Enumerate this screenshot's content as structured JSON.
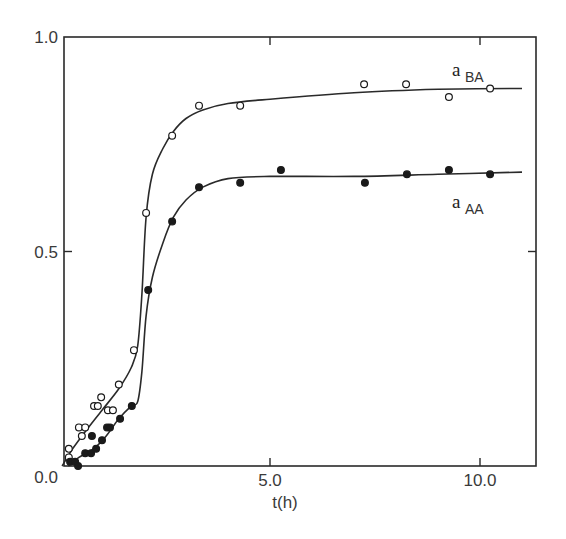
{
  "chart_data": {
    "type": "scatter",
    "title": "",
    "xlabel": "t(h)",
    "ylabel": "",
    "xlim": [
      0,
      11.3
    ],
    "ylim": [
      0.0,
      1.0
    ],
    "grid": false,
    "legend_position": "inline labels at right end of curves",
    "x_ticks": [
      0,
      5.0,
      10.0
    ],
    "x_tick_labels": [
      "",
      "5.0",
      "10.0"
    ],
    "y_ticks": [
      0.0,
      0.5,
      1.0
    ],
    "y_tick_labels": [
      "0.0",
      "0.5",
      "1.0"
    ],
    "series": [
      {
        "name": "a_BA",
        "label_main": "a",
        "label_sub": "BA",
        "marker": "open-circle",
        "points": [
          [
            0.21,
            0.02
          ],
          [
            0.21,
            0.04
          ],
          [
            0.45,
            0.09
          ],
          [
            0.52,
            0.07
          ],
          [
            0.6,
            0.09
          ],
          [
            0.81,
            0.14
          ],
          [
            0.9,
            0.14
          ],
          [
            0.98,
            0.16
          ],
          [
            1.14,
            0.13
          ],
          [
            1.26,
            0.13
          ],
          [
            1.4,
            0.19
          ],
          [
            1.76,
            0.27
          ],
          [
            2.05,
            0.59
          ],
          [
            2.67,
            0.77
          ],
          [
            3.31,
            0.84
          ],
          [
            4.29,
            0.84
          ],
          [
            7.24,
            0.89
          ],
          [
            8.24,
            0.89
          ],
          [
            9.26,
            0.86
          ],
          [
            10.24,
            0.88
          ]
        ],
        "fit_curve": [
          [
            0.05,
            0.0
          ],
          [
            0.3,
            0.04
          ],
          [
            0.6,
            0.08
          ],
          [
            1.0,
            0.13
          ],
          [
            1.4,
            0.18
          ],
          [
            1.7,
            0.23
          ],
          [
            1.85,
            0.28
          ],
          [
            1.95,
            0.4
          ],
          [
            2.05,
            0.58
          ],
          [
            2.2,
            0.68
          ],
          [
            2.45,
            0.74
          ],
          [
            2.7,
            0.78
          ],
          [
            3.0,
            0.81
          ],
          [
            3.4,
            0.83
          ],
          [
            4.0,
            0.845
          ],
          [
            5.0,
            0.855
          ],
          [
            7.0,
            0.87
          ],
          [
            9.0,
            0.878
          ],
          [
            11.0,
            0.88
          ]
        ]
      },
      {
        "name": "a_AA",
        "label_main": "a",
        "label_sub": "AA",
        "marker": "filled-circle",
        "points": [
          [
            0.24,
            0.01
          ],
          [
            0.36,
            0.01
          ],
          [
            0.43,
            0.0
          ],
          [
            0.6,
            0.03
          ],
          [
            0.74,
            0.03
          ],
          [
            0.76,
            0.07
          ],
          [
            0.86,
            0.04
          ],
          [
            1.0,
            0.06
          ],
          [
            1.12,
            0.09
          ],
          [
            1.19,
            0.09
          ],
          [
            1.43,
            0.11
          ],
          [
            1.71,
            0.14
          ],
          [
            2.1,
            0.41
          ],
          [
            2.67,
            0.57
          ],
          [
            3.31,
            0.65
          ],
          [
            4.29,
            0.66
          ],
          [
            5.26,
            0.69
          ],
          [
            7.26,
            0.66
          ],
          [
            8.26,
            0.68
          ],
          [
            9.26,
            0.69
          ],
          [
            10.24,
            0.68
          ]
        ],
        "fit_curve": [
          [
            0.2,
            0.0
          ],
          [
            0.45,
            0.02
          ],
          [
            0.8,
            0.04
          ],
          [
            1.1,
            0.07
          ],
          [
            1.4,
            0.11
          ],
          [
            1.7,
            0.14
          ],
          [
            1.85,
            0.15
          ],
          [
            1.95,
            0.22
          ],
          [
            2.05,
            0.35
          ],
          [
            2.2,
            0.44
          ],
          [
            2.45,
            0.52
          ],
          [
            2.7,
            0.58
          ],
          [
            3.0,
            0.62
          ],
          [
            3.4,
            0.65
          ],
          [
            4.0,
            0.67
          ],
          [
            5.0,
            0.675
          ],
          [
            7.0,
            0.675
          ],
          [
            9.0,
            0.68
          ],
          [
            11.0,
            0.685
          ]
        ]
      }
    ]
  }
}
